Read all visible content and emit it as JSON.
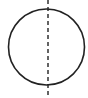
{
  "diagram": {
    "shape": "circle",
    "circle": {
      "cx": 46.5,
      "cy": 47,
      "r": 38,
      "stroke": "#222222",
      "stroke_width": 1.6
    },
    "symmetry_line": {
      "x": 48,
      "y1": 0,
      "y2": 98,
      "stroke": "#222222",
      "dash": "4,3",
      "orientation": "vertical"
    }
  }
}
